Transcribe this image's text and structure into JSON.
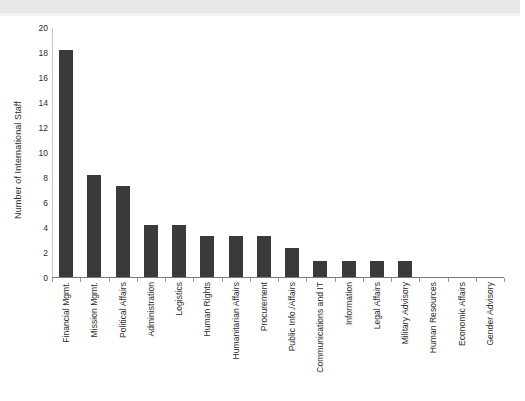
{
  "chart_data": {
    "type": "bar",
    "title": "",
    "subtitle": "",
    "xlabel": "",
    "ylabel": "Number of International Staff",
    "ylim": [
      0,
      20
    ],
    "yticks": [
      0,
      2,
      4,
      6,
      8,
      10,
      12,
      14,
      16,
      18,
      20
    ],
    "grid": false,
    "legend": null,
    "orientation": "vertical",
    "bar_color": "#3a3a3a",
    "categories": [
      "Financial Mgmt.",
      "Mission Mgmt.",
      "Political Affairs",
      "Administration",
      "Logistics",
      "Human Rights",
      "Humanitarian Affairs",
      "Procurement",
      "Public Info./Affairs",
      "Communications and IT",
      "Information",
      "Legal Affairs",
      "Military Advisory",
      "Human Resources",
      "Economic Affairs",
      "Gender Advisory"
    ],
    "values": [
      18.2,
      8.2,
      7.3,
      4.2,
      4.2,
      3.3,
      3.3,
      3.3,
      2.3,
      1.3,
      1.3,
      1.3,
      1.3,
      0,
      0,
      0
    ]
  },
  "colors": {
    "bar": "#3a3a3a",
    "axis": "#7a7a7a",
    "y_axis": "#c9c9c9",
    "text": "#2b2b2b",
    "background": "#ffffff",
    "scan_band": "#e8e8e8"
  }
}
